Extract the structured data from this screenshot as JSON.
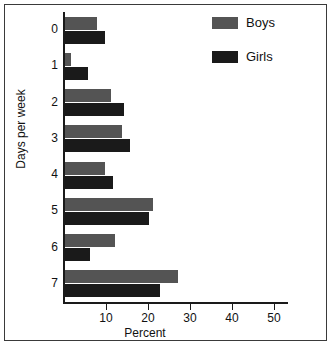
{
  "figure": {
    "background_color": "#ffffff",
    "border_color": "#3a3a3a"
  },
  "legend": {
    "position": "top-right",
    "entries": [
      {
        "label": "Boys",
        "color": "#545454",
        "swatch_name": "legend-swatch-boys"
      },
      {
        "label": "Girls",
        "color": "#1a1a1a",
        "swatch_name": "legend-swatch-girls"
      }
    ]
  },
  "axes": {
    "x": {
      "label": "Percent",
      "ticks": [
        10,
        20,
        30,
        40,
        50
      ],
      "tick_labels": [
        "10",
        "20",
        "30",
        "40",
        "50"
      ],
      "range": [
        0,
        53
      ]
    },
    "y": {
      "label": "Days per week",
      "tick_labels": [
        "0",
        "1",
        "2",
        "3",
        "4",
        "5",
        "6",
        "7"
      ]
    }
  },
  "chart_data": {
    "type": "bar",
    "orientation": "horizontal",
    "title": "",
    "xlabel": "Percent",
    "ylabel": "Days per week",
    "categories": [
      "0",
      "1",
      "2",
      "3",
      "4",
      "5",
      "6",
      "7"
    ],
    "series": [
      {
        "name": "Boys",
        "color": "#545454",
        "values": [
          7.5,
          1.5,
          11.0,
          13.5,
          9.5,
          21.0,
          12.0,
          27.0
        ]
      },
      {
        "name": "Girls",
        "color": "#1a1a1a",
        "values": [
          9.5,
          5.5,
          14.0,
          15.5,
          11.5,
          20.0,
          6.0,
          22.5
        ]
      }
    ],
    "xlim": [
      0,
      53
    ],
    "ylim": [
      0,
      8
    ],
    "grid": false,
    "legend_position": "top-right"
  }
}
